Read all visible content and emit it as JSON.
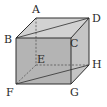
{
  "diagram": {
    "type": "cube",
    "colors": {
      "front_face": "#b4b4b4",
      "top_face": "#d2d2d2",
      "side_face": "#c4c4c4",
      "edge": "#2e2e2e",
      "hidden_edge": "#555555"
    },
    "vertices": {
      "A": {
        "label": "A",
        "x": 36,
        "y": 18,
        "lx": 32,
        "ly": 13
      },
      "D": {
        "label": "D",
        "x": 89,
        "y": 18,
        "lx": 92,
        "ly": 22
      },
      "B": {
        "label": "B",
        "x": 16,
        "y": 38,
        "lx": 4,
        "ly": 43
      },
      "C": {
        "label": "C",
        "x": 71,
        "y": 38,
        "lx": 70,
        "ly": 47
      },
      "E": {
        "label": "E",
        "x": 36,
        "y": 65,
        "lx": 36,
        "ly": 63
      },
      "H": {
        "label": "H",
        "x": 89,
        "y": 65,
        "lx": 92,
        "ly": 68
      },
      "F": {
        "label": "F",
        "x": 16,
        "y": 84,
        "lx": 6,
        "ly": 96
      },
      "G": {
        "label": "G",
        "x": 71,
        "y": 84,
        "lx": 70,
        "ly": 96
      }
    },
    "diagonals": [
      "BD",
      "FH"
    ],
    "hidden_edges": [
      "AE",
      "EF",
      "EH"
    ]
  }
}
